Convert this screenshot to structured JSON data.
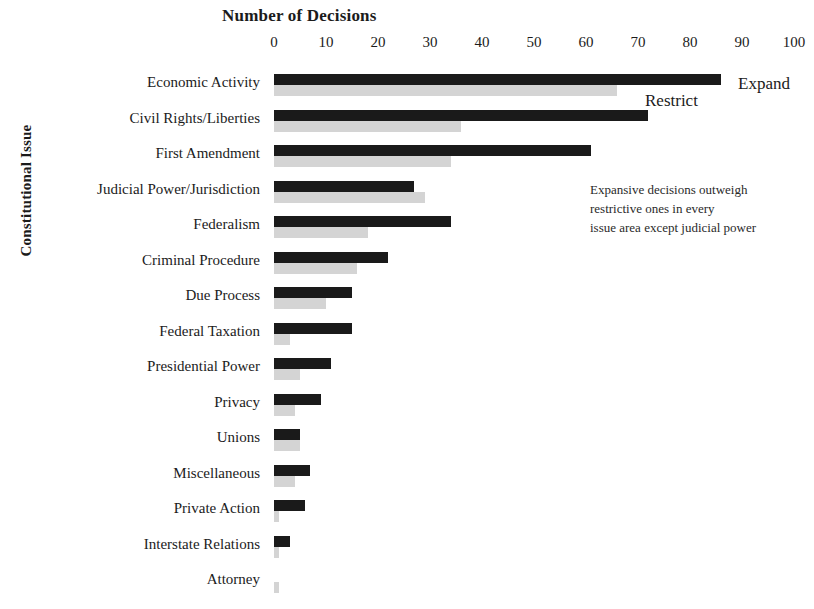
{
  "chart_data": {
    "type": "bar",
    "orientation": "horizontal",
    "title": "Number of Decisions",
    "xlabel": "Number of Decisions",
    "ylabel": "Constitutional Issue",
    "xlim": [
      0,
      100
    ],
    "xticks": [
      0,
      10,
      20,
      30,
      40,
      50,
      60,
      70,
      80,
      90,
      100
    ],
    "xtick_labels": [
      "0",
      "10",
      "20",
      "30",
      "40",
      "50",
      "60",
      "70",
      "80",
      "90",
      "100"
    ],
    "grid": false,
    "legend_position": "inline-right-of-first-bars",
    "categories": [
      "Economic Activity",
      "Civil Rights/Liberties",
      "First Amendment",
      "Judicial Power/Jurisdiction",
      "Federalism",
      "Criminal Procedure",
      "Due Process",
      "Federal Taxation",
      "Presidential Power",
      "Privacy",
      "Unions",
      "Miscellaneous",
      "Private Action",
      "Interstate Relations",
      "Attorney"
    ],
    "series": [
      {
        "name": "Expand",
        "color": "#1a1a1a",
        "values": [
          86,
          72,
          61,
          27,
          34,
          22,
          15,
          15,
          11,
          9,
          5,
          7,
          6,
          3,
          0
        ]
      },
      {
        "name": "Restrict",
        "color": "#d4d4d4",
        "values": [
          66,
          36,
          34,
          29,
          18,
          16,
          10,
          3,
          5,
          4,
          5,
          4,
          1,
          1,
          1
        ]
      }
    ],
    "annotation": [
      "Expansive decisions outweigh",
      "restrictive ones in every",
      "issue area except judicial power"
    ]
  },
  "colors": {
    "expand": "#1a1a1a",
    "restrict": "#d4d4d4",
    "text": "#1b1b1b",
    "background": "#ffffff"
  }
}
